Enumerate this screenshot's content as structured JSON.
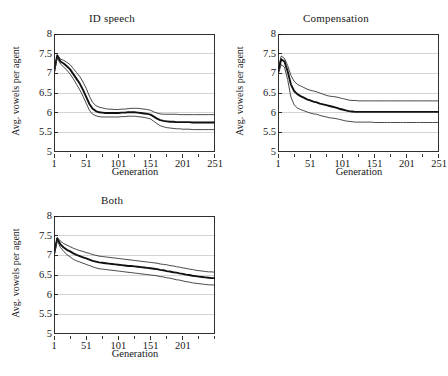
{
  "figure": {
    "background": "#ffffff",
    "axis_color": "#1a1a1a",
    "grid_color": "#c9c9c9",
    "mean_color": "#111111",
    "bound_color": "#333333"
  },
  "common": {
    "ylabel": "Avg. vowels per agent",
    "xlabel": "Generation",
    "yticks": [
      "5",
      "5.5",
      "6",
      "6.5",
      "7",
      "7.5",
      "8"
    ],
    "ytick_values": [
      5,
      5.5,
      6,
      6.5,
      7,
      7.5,
      8
    ],
    "ylim": [
      5,
      8
    ]
  },
  "chart_data": [
    {
      "type": "line",
      "panel": "a",
      "title": "ID speech",
      "xlabel": "Generation",
      "ylabel": "Avg. vowels per agent",
      "xlim": [
        1,
        251
      ],
      "ylim": [
        5,
        8
      ],
      "xticks": [
        1,
        51,
        101,
        151,
        201,
        251
      ],
      "xtick_labels": [
        "1",
        "51",
        "101",
        "151",
        "201",
        "251"
      ],
      "minor_xticks": [
        26,
        76,
        126,
        176,
        226
      ],
      "grid": "horizontal",
      "legend": "none",
      "x": [
        1,
        6,
        11,
        16,
        21,
        26,
        31,
        36,
        41,
        46,
        51,
        56,
        61,
        66,
        71,
        76,
        81,
        86,
        91,
        96,
        101,
        106,
        111,
        116,
        121,
        126,
        131,
        136,
        141,
        146,
        151,
        156,
        161,
        166,
        171,
        176,
        181,
        186,
        191,
        196,
        201,
        206,
        211,
        216,
        221,
        226,
        231,
        236,
        241,
        246,
        251
      ],
      "series": [
        {
          "name": "upper bound",
          "values": [
            7.05,
            7.48,
            7.36,
            7.33,
            7.28,
            7.22,
            7.12,
            7.02,
            6.92,
            6.78,
            6.62,
            6.42,
            6.26,
            6.18,
            6.14,
            6.12,
            6.1,
            6.09,
            6.09,
            6.08,
            6.08,
            6.09,
            6.09,
            6.1,
            6.11,
            6.11,
            6.11,
            6.1,
            6.09,
            6.08,
            6.06,
            6.02,
            5.99,
            5.97,
            5.96,
            5.96,
            5.96,
            5.96,
            5.96,
            5.95,
            5.95,
            5.95,
            5.95,
            5.95,
            5.95,
            5.95,
            5.95,
            5.95,
            5.95,
            5.95,
            5.95
          ]
        },
        {
          "name": "mean",
          "values": [
            7.02,
            7.45,
            7.3,
            7.25,
            7.18,
            7.1,
            6.98,
            6.86,
            6.74,
            6.58,
            6.4,
            6.22,
            6.1,
            6.04,
            6.01,
            6.0,
            5.99,
            5.99,
            5.99,
            5.99,
            5.99,
            6.0,
            6.0,
            6.01,
            6.01,
            6.01,
            6.0,
            5.99,
            5.98,
            5.97,
            5.95,
            5.9,
            5.85,
            5.81,
            5.79,
            5.78,
            5.77,
            5.77,
            5.76,
            5.76,
            5.76,
            5.76,
            5.76,
            5.75,
            5.75,
            5.75,
            5.75,
            5.75,
            5.75,
            5.75,
            5.75
          ]
        },
        {
          "name": "lower bound",
          "values": [
            6.98,
            7.4,
            7.24,
            7.16,
            7.08,
            6.98,
            6.86,
            6.72,
            6.58,
            6.42,
            6.24,
            6.06,
            5.96,
            5.92,
            5.9,
            5.89,
            5.89,
            5.89,
            5.89,
            5.89,
            5.89,
            5.9,
            5.9,
            5.91,
            5.91,
            5.91,
            5.9,
            5.89,
            5.88,
            5.86,
            5.84,
            5.78,
            5.72,
            5.67,
            5.64,
            5.62,
            5.61,
            5.6,
            5.59,
            5.59,
            5.58,
            5.58,
            5.58,
            5.57,
            5.57,
            5.57,
            5.57,
            5.57,
            5.57,
            5.57,
            5.57
          ]
        }
      ]
    },
    {
      "type": "line",
      "panel": "b",
      "title": "Compensation",
      "xlabel": "Generation",
      "ylabel": "Avg. vowels per agent",
      "xlim": [
        1,
        251
      ],
      "ylim": [
        5,
        8
      ],
      "xticks": [
        1,
        51,
        101,
        151,
        201,
        251
      ],
      "xtick_labels": [
        "1",
        "51",
        "101",
        "151",
        "201",
        "251"
      ],
      "minor_xticks": [
        26,
        76,
        126,
        176,
        226
      ],
      "grid": "horizontal",
      "legend": "none",
      "x": [
        1,
        6,
        11,
        16,
        21,
        26,
        31,
        36,
        41,
        46,
        51,
        56,
        61,
        66,
        71,
        76,
        81,
        86,
        91,
        96,
        101,
        106,
        111,
        116,
        121,
        126,
        131,
        136,
        141,
        146,
        151,
        156,
        161,
        166,
        171,
        176,
        181,
        186,
        191,
        196,
        201,
        206,
        211,
        216,
        221,
        226,
        231,
        236,
        241,
        246,
        251
      ],
      "series": [
        {
          "name": "upper bound",
          "values": [
            7.08,
            7.44,
            7.38,
            7.2,
            6.95,
            6.8,
            6.72,
            6.68,
            6.64,
            6.6,
            6.57,
            6.55,
            6.53,
            6.5,
            6.47,
            6.44,
            6.42,
            6.41,
            6.4,
            6.38,
            6.36,
            6.34,
            6.32,
            6.31,
            6.31,
            6.3,
            6.3,
            6.3,
            6.3,
            6.3,
            6.3,
            6.3,
            6.3,
            6.3,
            6.3,
            6.3,
            6.3,
            6.3,
            6.3,
            6.3,
            6.3,
            6.3,
            6.3,
            6.3,
            6.3,
            6.3,
            6.3,
            6.3,
            6.3,
            6.3,
            6.3
          ]
        },
        {
          "name": "mean",
          "values": [
            7.02,
            7.36,
            7.3,
            7.05,
            6.72,
            6.55,
            6.47,
            6.42,
            6.38,
            6.34,
            6.31,
            6.28,
            6.26,
            6.23,
            6.21,
            6.19,
            6.17,
            6.15,
            6.13,
            6.1,
            6.08,
            6.06,
            6.04,
            6.03,
            6.02,
            6.02,
            6.02,
            6.02,
            6.02,
            6.02,
            6.02,
            6.02,
            6.02,
            6.02,
            6.02,
            6.02,
            6.02,
            6.02,
            6.02,
            6.02,
            6.02,
            6.02,
            6.02,
            6.02,
            6.02,
            6.02,
            6.02,
            6.02,
            6.02,
            6.02,
            6.02
          ]
        },
        {
          "name": "lower bound",
          "values": [
            6.96,
            7.22,
            7.16,
            6.84,
            6.4,
            6.2,
            6.12,
            6.08,
            6.05,
            6.02,
            5.99,
            5.97,
            5.96,
            5.93,
            5.91,
            5.89,
            5.87,
            5.86,
            5.85,
            5.83,
            5.81,
            5.79,
            5.78,
            5.77,
            5.76,
            5.76,
            5.76,
            5.76,
            5.76,
            5.76,
            5.75,
            5.75,
            5.75,
            5.75,
            5.75,
            5.75,
            5.75,
            5.75,
            5.75,
            5.75,
            5.75,
            5.75,
            5.75,
            5.75,
            5.75,
            5.75,
            5.75,
            5.75,
            5.75,
            5.75,
            5.75
          ]
        }
      ]
    },
    {
      "type": "line",
      "panel": "c",
      "title": "Both",
      "xlabel": "Generation",
      "ylabel": "Avg. vowels per agent",
      "xlim": [
        1,
        251
      ],
      "ylim": [
        5,
        8
      ],
      "xticks": [
        1,
        51,
        101,
        151,
        201
      ],
      "xtick_labels": [
        "1",
        "51",
        "101",
        "151",
        "201"
      ],
      "minor_xticks": [
        26,
        76,
        126,
        176,
        226,
        251
      ],
      "grid": "horizontal",
      "legend": "none",
      "x": [
        1,
        6,
        11,
        16,
        21,
        26,
        31,
        36,
        41,
        46,
        51,
        56,
        61,
        66,
        71,
        76,
        81,
        86,
        91,
        96,
        101,
        106,
        111,
        116,
        121,
        126,
        131,
        136,
        141,
        146,
        151,
        156,
        161,
        166,
        171,
        176,
        181,
        186,
        191,
        196,
        201,
        206,
        211,
        216,
        221,
        226,
        231,
        236,
        241,
        246,
        251
      ],
      "series": [
        {
          "name": "upper bound",
          "values": [
            7.06,
            7.46,
            7.36,
            7.3,
            7.26,
            7.22,
            7.18,
            7.15,
            7.12,
            7.1,
            7.07,
            7.05,
            7.02,
            7.0,
            6.98,
            6.97,
            6.96,
            6.95,
            6.94,
            6.93,
            6.92,
            6.91,
            6.9,
            6.89,
            6.88,
            6.87,
            6.86,
            6.85,
            6.84,
            6.83,
            6.82,
            6.81,
            6.8,
            6.78,
            6.77,
            6.76,
            6.74,
            6.73,
            6.71,
            6.7,
            6.68,
            6.67,
            6.65,
            6.64,
            6.62,
            6.61,
            6.6,
            6.59,
            6.58,
            6.58,
            6.57
          ]
        },
        {
          "name": "mean",
          "values": [
            7.02,
            7.42,
            7.28,
            7.2,
            7.14,
            7.1,
            7.05,
            7.01,
            6.98,
            6.95,
            6.92,
            6.89,
            6.86,
            6.84,
            6.82,
            6.81,
            6.8,
            6.79,
            6.78,
            6.77,
            6.76,
            6.75,
            6.74,
            6.73,
            6.73,
            6.72,
            6.71,
            6.7,
            6.69,
            6.68,
            6.67,
            6.66,
            6.65,
            6.63,
            6.62,
            6.6,
            6.59,
            6.57,
            6.56,
            6.54,
            6.53,
            6.51,
            6.5,
            6.48,
            6.47,
            6.46,
            6.45,
            6.44,
            6.43,
            6.42,
            6.42
          ]
        },
        {
          "name": "lower bound",
          "values": [
            6.98,
            7.38,
            7.2,
            7.1,
            7.02,
            6.96,
            6.9,
            6.86,
            6.83,
            6.8,
            6.77,
            6.74,
            6.71,
            6.68,
            6.66,
            6.65,
            6.64,
            6.63,
            6.62,
            6.61,
            6.6,
            6.59,
            6.58,
            6.57,
            6.56,
            6.55,
            6.54,
            6.53,
            6.52,
            6.51,
            6.5,
            6.49,
            6.48,
            6.46,
            6.45,
            6.43,
            6.42,
            6.4,
            6.38,
            6.37,
            6.35,
            6.33,
            6.32,
            6.3,
            6.29,
            6.28,
            6.27,
            6.26,
            6.25,
            6.25,
            6.24
          ]
        }
      ]
    }
  ]
}
